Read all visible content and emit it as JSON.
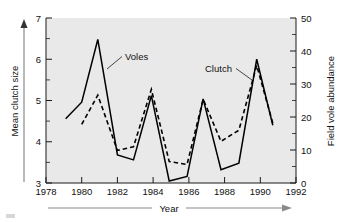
{
  "figure": {
    "width": 347,
    "height": 222,
    "background_color": "#ffffff",
    "plot_background_color": "#e9e9e9",
    "line_color": "#000000"
  },
  "chart_data": {
    "type": "line",
    "title": "",
    "subtitle": "",
    "xlabel": "Year",
    "ylabel": "Mean clutch size",
    "y2label": "Field vole abundance",
    "xlim": [
      1978,
      1992
    ],
    "ylim": [
      3,
      7
    ],
    "y2lim": [
      0,
      50
    ],
    "xticks": [
      1978,
      1980,
      1982,
      1984,
      1986,
      1988,
      1990,
      1992
    ],
    "xtick_labels": [
      "1978",
      "1980",
      "1982",
      "1984",
      "1986",
      "1988",
      "1990",
      "1992"
    ],
    "yticks": [
      3,
      4,
      5,
      6,
      7
    ],
    "ytick_labels": [
      "3",
      "4",
      "5",
      "6",
      "7"
    ],
    "yticks_minor": [
      3.5,
      4.5,
      5.5,
      6.5
    ],
    "y2ticks": [
      0,
      10,
      20,
      30,
      40,
      50
    ],
    "y2tick_labels": [
      "0",
      "10",
      "20",
      "30",
      "40",
      "50"
    ],
    "y2ticks_minor": [
      5,
      15,
      25,
      35,
      45
    ],
    "grid": false,
    "legend_position": "inline-annotations",
    "series": [
      {
        "name": "Voles",
        "style": "solid",
        "axis": "right",
        "annotation": "Voles",
        "x": [
          1979.1,
          1980.0,
          1980.9,
          1982.0,
          1982.9,
          1983.9,
          1984.9,
          1985.9,
          1986.8,
          1987.8,
          1988.8,
          1989.8,
          1990.7
        ],
        "values": [
          19.5,
          24.5,
          43.5,
          8.5,
          7.0,
          26.5,
          0.6,
          2.0,
          25.5,
          4.0,
          6.0,
          37.5,
          17.5
        ]
      },
      {
        "name": "Clutch",
        "style": "dashed",
        "axis": "left",
        "annotation": "Clutch",
        "x": [
          1980.0,
          1980.9,
          1982.0,
          1982.9,
          1983.9,
          1984.9,
          1985.9,
          1986.8,
          1987.8,
          1988.8,
          1989.8,
          1990.7
        ],
        "values": [
          4.42,
          5.13,
          3.79,
          3.88,
          5.27,
          3.52,
          3.45,
          5.03,
          4.01,
          4.28,
          5.85,
          4.45
        ]
      }
    ],
    "annotations": [
      {
        "text": "Voles",
        "x": 1983.0,
        "y": 5.95
      },
      {
        "text": "Clutch",
        "x": 1987.5,
        "y": 5.55
      }
    ]
  },
  "axis_arrows": {
    "x_arrow_label": "Year",
    "y_arrow_label": "Mean clutch size"
  }
}
